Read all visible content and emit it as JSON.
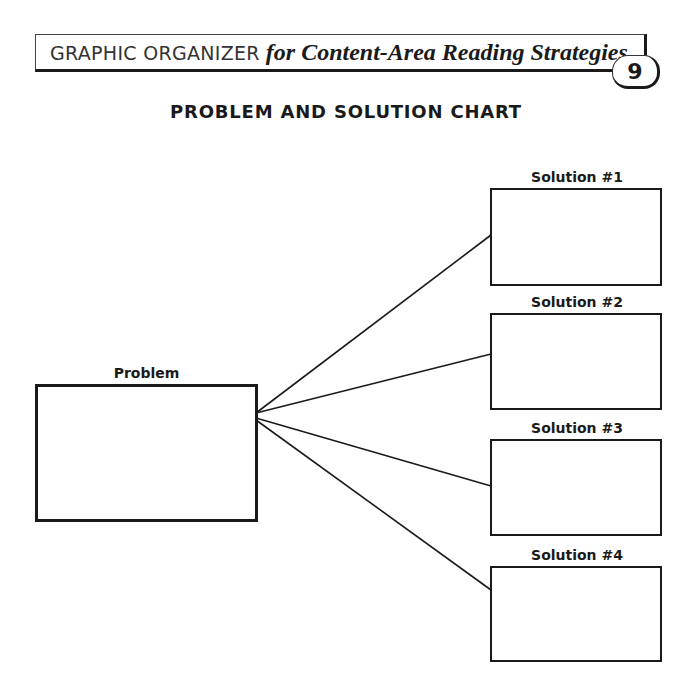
{
  "header": {
    "caps_text": "GRAPHIC ORGANIZER",
    "italic_text": "for Content-Area Reading Strategies",
    "badge_number": "9"
  },
  "page_title": "PROBLEM AND SOLUTION CHART",
  "problem": {
    "label": "Problem",
    "content": ""
  },
  "solutions": [
    {
      "label": "Solution #1",
      "content": ""
    },
    {
      "label": "Solution #2",
      "content": ""
    },
    {
      "label": "Solution #3",
      "content": ""
    },
    {
      "label": "Solution #4",
      "content": ""
    }
  ],
  "colors": {
    "ink": "#1a1a1a",
    "background": "#ffffff"
  }
}
